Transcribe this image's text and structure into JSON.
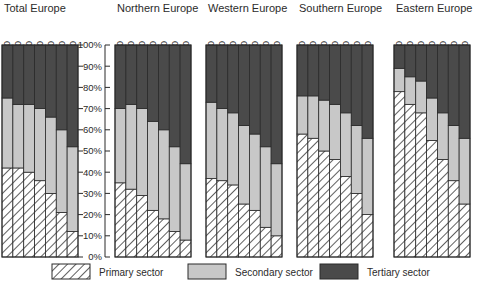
{
  "figure": {
    "title": "",
    "axis": {
      "ylabel": "",
      "ytick_labels": [
        "100%",
        "90%",
        "80%",
        "70%",
        "60%",
        "50%",
        "40%",
        "30%",
        "20%",
        "10%",
        "0%"
      ],
      "ymin": 0,
      "ymax": 100
    }
  },
  "legend": {
    "items": [
      {
        "key": "primary",
        "label": "Primary sector",
        "swatch": "hatched",
        "color": "#ffffff"
      },
      {
        "key": "secondary",
        "label": "Secondary sector",
        "swatch": "solid",
        "color": "#c8c8c8"
      },
      {
        "key": "tertiary",
        "label": "Tertiary sector",
        "swatch": "solid",
        "color": "#4a4a4a"
      }
    ]
  },
  "chart_data": {
    "type": "bar",
    "subtype": "stacked-100-percent",
    "title": "",
    "xlabel": "",
    "ylabel": "",
    "ylim": [
      0,
      100
    ],
    "grid": false,
    "legend_position": "bottom",
    "categories": [
      "1910",
      "1920",
      "1930",
      "1940",
      "1950",
      "1960",
      "1970"
    ],
    "series_names": [
      "Primary sector",
      "Secondary sector",
      "Tertiary sector"
    ],
    "panels": [
      {
        "name": "Total Europe",
        "series": [
          {
            "name": "Primary sector",
            "values": [
              42,
              42,
              40,
              36,
              30,
              21,
              12
            ]
          },
          {
            "name": "Secondary sector",
            "values": [
              33,
              30,
              32,
              34,
              36,
              39,
              40
            ]
          },
          {
            "name": "Tertiary sector",
            "values": [
              25,
              28,
              28,
              30,
              34,
              40,
              48
            ]
          }
        ]
      },
      {
        "name": "Northern Europe",
        "series": [
          {
            "name": "Primary sector",
            "values": [
              35,
              32,
              29,
              22,
              18,
              12,
              8
            ]
          },
          {
            "name": "Secondary sector",
            "values": [
              35,
              40,
              41,
              42,
              42,
              40,
              36
            ]
          },
          {
            "name": "Tertiary sector",
            "values": [
              30,
              28,
              30,
              36,
              40,
              48,
              56
            ]
          }
        ]
      },
      {
        "name": "Western Europe",
        "series": [
          {
            "name": "Primary sector",
            "values": [
              37,
              36,
              34,
              25,
              22,
              14,
              10
            ]
          },
          {
            "name": "Secondary sector",
            "values": [
              36,
              34,
              34,
              37,
              36,
              38,
              34
            ]
          },
          {
            "name": "Tertiary sector",
            "values": [
              27,
              30,
              32,
              38,
              42,
              48,
              56
            ]
          }
        ]
      },
      {
        "name": "Southern Europe",
        "series": [
          {
            "name": "Primary sector",
            "values": [
              58,
              56,
              50,
              46,
              38,
              30,
              20
            ]
          },
          {
            "name": "Secondary sector",
            "values": [
              18,
              20,
              24,
              26,
              30,
              32,
              36
            ]
          },
          {
            "name": "Tertiary sector",
            "values": [
              24,
              24,
              26,
              28,
              32,
              38,
              44
            ]
          }
        ]
      },
      {
        "name": "Eastern Europe",
        "series": [
          {
            "name": "Primary sector",
            "values": [
              78,
              72,
              68,
              55,
              46,
              36,
              25
            ]
          },
          {
            "name": "Secondary sector",
            "values": [
              11,
              13,
              15,
              20,
              22,
              26,
              31
            ]
          },
          {
            "name": "Tertiary sector",
            "values": [
              11,
              15,
              17,
              25,
              32,
              38,
              44
            ]
          }
        ]
      }
    ]
  }
}
